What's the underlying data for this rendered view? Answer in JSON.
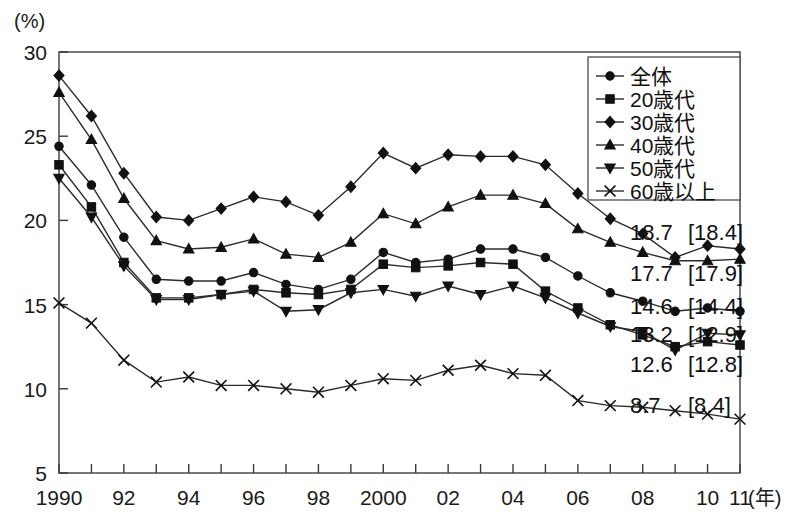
{
  "chart_data": {
    "type": "line",
    "title": "",
    "xlabel": "(年)",
    "ylabel": "(%)",
    "ylim": [
      5,
      30
    ],
    "yticks": [
      5,
      10,
      15,
      20,
      25,
      30
    ],
    "ytick_labels": [
      "5",
      "10",
      "15",
      "20",
      "25",
      "30"
    ],
    "x": [
      1990,
      1991,
      1992,
      1993,
      1994,
      1995,
      1996,
      1997,
      1998,
      1999,
      2000,
      2001,
      2002,
      2003,
      2004,
      2005,
      2006,
      2007,
      2008,
      2009,
      2010,
      2011
    ],
    "xtick_labels": [
      "1990",
      "",
      "92",
      "",
      "94",
      "",
      "96",
      "",
      "98",
      "",
      "2000",
      "",
      "02",
      "",
      "04",
      "",
      "06",
      "",
      "08",
      "",
      "10",
      "11"
    ],
    "grid": false,
    "legend_position": "top-right",
    "series": [
      {
        "name": "全体",
        "marker": "circle",
        "values": [
          24.4,
          22.1,
          19.0,
          16.5,
          16.4,
          16.4,
          16.9,
          16.2,
          15.9,
          16.5,
          18.1,
          17.5,
          17.7,
          18.3,
          18.3,
          17.8,
          16.7,
          15.7,
          15.2,
          14.6,
          14.8,
          14.6
        ],
        "end_label": "14.6",
        "end_label_prev": "[14.4]"
      },
      {
        "name": "20歳代",
        "marker": "square",
        "values": [
          23.3,
          20.8,
          17.5,
          15.4,
          15.4,
          15.6,
          15.9,
          15.7,
          15.6,
          15.9,
          17.4,
          17.2,
          17.3,
          17.5,
          17.4,
          15.8,
          14.8,
          13.8,
          13.2,
          12.5,
          12.8,
          12.6
        ],
        "end_label": "12.6",
        "end_label_prev": "[12.8]"
      },
      {
        "name": "30歳代",
        "marker": "diamond",
        "values": [
          28.6,
          26.2,
          22.8,
          20.2,
          20.0,
          20.7,
          21.4,
          21.1,
          20.3,
          22.0,
          24.0,
          23.1,
          23.9,
          23.8,
          23.8,
          23.3,
          21.6,
          20.1,
          19.2,
          17.8,
          18.5,
          18.3
        ],
        "end_label": "18.7",
        "end_label_prev": "[18.4]"
      },
      {
        "name": "40歳代",
        "marker": "triangle-up",
        "values": [
          27.6,
          24.8,
          21.3,
          18.8,
          18.3,
          18.4,
          18.9,
          18.0,
          17.8,
          18.7,
          20.4,
          19.8,
          20.8,
          21.5,
          21.5,
          21.0,
          19.5,
          18.7,
          18.1,
          17.6,
          17.6,
          17.7
        ],
        "end_label": "17.7",
        "end_label_prev": "[17.9]"
      },
      {
        "name": "50歳代",
        "marker": "triangle-down",
        "values": [
          22.5,
          20.2,
          17.3,
          15.3,
          15.3,
          15.6,
          15.8,
          14.6,
          14.7,
          15.7,
          15.9,
          15.5,
          16.1,
          15.6,
          16.1,
          15.4,
          14.5,
          13.7,
          13.4,
          12.3,
          13.3,
          13.2
        ],
        "end_label": "13.2",
        "end_label_prev": "[12.9]"
      },
      {
        "name": "60歳以上",
        "marker": "x",
        "values": [
          15.1,
          13.9,
          11.7,
          10.4,
          10.7,
          10.2,
          10.2,
          10.0,
          9.8,
          10.2,
          10.6,
          10.5,
          11.1,
          11.4,
          10.9,
          10.8,
          9.3,
          9.0,
          8.9,
          8.7,
          8.5,
          8.2
        ],
        "end_label": "8.7",
        "end_label_prev": "[8.4]"
      }
    ],
    "end_labels": [
      {
        "value": "18.7",
        "prev": "[18.4]"
      },
      {
        "value": "17.7",
        "prev": "[17.9]"
      },
      {
        "value": "14.6",
        "prev": "[14.4]"
      },
      {
        "value": "13.2",
        "prev": "[12.9]"
      },
      {
        "value": "12.6",
        "prev": "[12.8]"
      },
      {
        "value": "8.7",
        "prev": "[8.4]"
      }
    ]
  },
  "legend": {
    "items": [
      {
        "label": "全体",
        "marker": "circle"
      },
      {
        "label": "20歳代",
        "marker": "square"
      },
      {
        "label": "30歳代",
        "marker": "diamond"
      },
      {
        "label": "40歳代",
        "marker": "triangle-up"
      },
      {
        "label": "50歳代",
        "marker": "triangle-down"
      },
      {
        "label": "60歳以上",
        "marker": "x"
      }
    ]
  },
  "axes": {
    "y_unit": "(%)",
    "x_unit": "(年)"
  }
}
